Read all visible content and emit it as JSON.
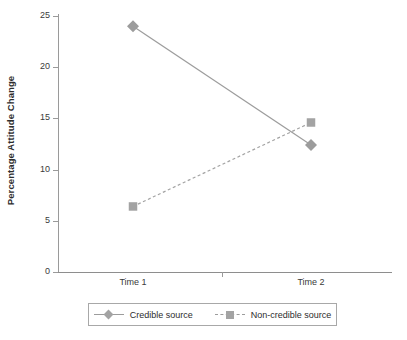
{
  "chart_data": {
    "type": "line",
    "title": "",
    "xlabel": "",
    "ylabel": "Percentage Attitude Change",
    "categories": [
      "Time 1",
      "Time 2"
    ],
    "ylim": [
      0,
      25
    ],
    "yticks": [
      0,
      5,
      10,
      15,
      20,
      25
    ],
    "ytick_labels": [
      "0",
      "5",
      "10",
      "15",
      "20",
      "25"
    ],
    "grid": false,
    "legend_position": "bottom",
    "series": [
      {
        "name": "Credible source",
        "values": [
          24.0,
          12.4
        ],
        "marker": "diamond",
        "line_style": "solid",
        "color": "#9c9c9c"
      },
      {
        "name": "Non-credible source",
        "values": [
          6.4,
          14.6
        ],
        "marker": "square",
        "line_style": "dashed",
        "color": "#a3a3a3"
      }
    ]
  },
  "axes": {
    "y_title": "Percentage Attitude Change",
    "y_tick_labels": [
      "25",
      "20",
      "15",
      "10",
      "5",
      "0"
    ],
    "x_tick_labels": [
      "Time 1",
      "Time 2"
    ]
  },
  "legend": {
    "entries": [
      {
        "label": "Credible source"
      },
      {
        "label": "Non-credible source"
      }
    ]
  },
  "colors": {
    "series_1": "#9c9c9c",
    "series_2": "#a3a3a3",
    "axis": "#9a9a9a",
    "text": "#2d2d2d",
    "background": "#ffffff"
  }
}
